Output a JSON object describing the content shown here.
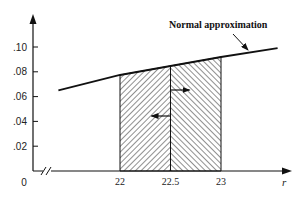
{
  "chart_data": {
    "type": "area",
    "title": "",
    "xlabel": "r",
    "ylabel": "",
    "ylim": [
      0,
      0.1
    ],
    "y_ticks": [
      {
        "value": 0,
        "label": "0"
      },
      {
        "value": 0.02,
        "label": ".02"
      },
      {
        "value": 0.04,
        "label": ".04"
      },
      {
        "value": 0.06,
        "label": ".06"
      },
      {
        "value": 0.08,
        "label": ".08"
      },
      {
        "value": 0.1,
        "label": ".10"
      }
    ],
    "x_ticks": [
      {
        "value": 22,
        "label": "22"
      },
      {
        "value": 22.5,
        "label": "22.5"
      },
      {
        "value": 23,
        "label": "23"
      }
    ],
    "axis_break": true,
    "grid": false,
    "series": [
      {
        "name": "Normal approximation",
        "type": "line",
        "x": [
          21.39,
          22,
          22.5,
          23,
          23.56
        ],
        "y": [
          0.065,
          0.0774,
          0.0847,
          0.0919,
          0.099
        ]
      }
    ],
    "shaded_regions": [
      {
        "name": "left-half",
        "x_from": 22,
        "x_to": 22.5,
        "hatch": "forward",
        "arrow_direction": "left"
      },
      {
        "name": "right-half",
        "x_from": 22.5,
        "x_to": 23,
        "hatch": "backward",
        "arrow_direction": "right"
      }
    ],
    "annotations": [
      {
        "text": "Normal approximation",
        "points_to_x": 23.28
      }
    ]
  }
}
